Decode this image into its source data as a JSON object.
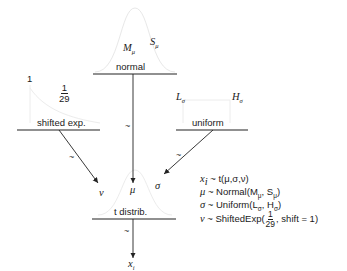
{
  "nodes": {
    "normal": {
      "label": "normal",
      "params": {
        "left": "M",
        "left_sub": "μ",
        "right": "S",
        "right_sub": "μ"
      }
    },
    "shifted_exp": {
      "label": "shifted exp.",
      "params": {
        "left": "1",
        "frac_num": "1",
        "frac_den": "29"
      }
    },
    "uniform": {
      "label": "uniform",
      "params": {
        "left": "L",
        "left_sub": "σ",
        "right": "H",
        "right_sub": "σ"
      }
    },
    "t_distrib": {
      "label": "t distrib.",
      "inputs": {
        "nu": "ν",
        "mu": "μ",
        "sigma": "σ"
      }
    },
    "output": {
      "label": "x",
      "sub": "i"
    }
  },
  "edge_label": "~",
  "equations": [
    {
      "lhs": "x",
      "lhs_sub": "i",
      "rhs": " ~ t(μ,σ,ν)"
    },
    {
      "lhs": "μ",
      "rhs": " ~ Normal(M",
      "sub1": "μ",
      "mid": ", S",
      "sub2": "μ",
      "end": ")"
    },
    {
      "lhs": "σ",
      "rhs": " ~ Uniform(L",
      "sub1": "σ",
      "mid": ", H",
      "sub2": "σ",
      "end": ")"
    },
    {
      "lhs": "ν",
      "rhs": " ~ ShiftedExp(",
      "frac_num": "1",
      "frac_den": "29",
      "end": ", shift = 1)"
    }
  ],
  "colors": {
    "line": "#222222",
    "curve": "#e6e6e6"
  }
}
